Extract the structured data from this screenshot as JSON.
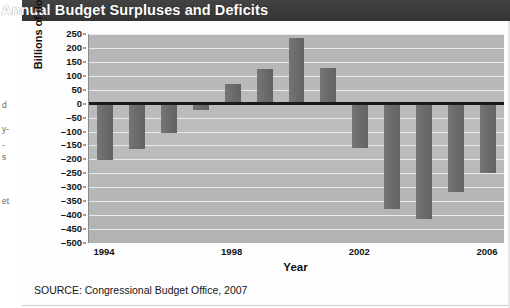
{
  "header": {
    "title": "Annual Budget Surpluses and Deficits"
  },
  "margin_fragments": [
    {
      "text": "d",
      "top": 100
    },
    {
      "text": "y-",
      "top": 124
    },
    {
      "text": "-",
      "top": 140
    },
    {
      "text": "s",
      "top": 152
    },
    {
      "text": "et",
      "top": 196
    }
  ],
  "source": {
    "text": "SOURCE: Congressional Budget Office, 2007"
  },
  "colors": {
    "title_bar": "#3a3a3a",
    "panel": "#b9b9b9",
    "bar": "#6e6e6e",
    "gridline": "#efefef",
    "zero_line": "#1a1a1a",
    "text": "#141414"
  },
  "chart_data": {
    "type": "bar",
    "title": "Annual Budget Surpluses and Deficits",
    "xlabel": "Year",
    "ylabel": "Billions of dollars",
    "ylim": [
      -500,
      250
    ],
    "yticks": [
      250,
      200,
      150,
      100,
      50,
      0,
      -50,
      -100,
      -150,
      -200,
      -250,
      -300,
      -350,
      -400,
      -450,
      -500
    ],
    "ytick_labels": [
      "250",
      "200",
      "150",
      "100",
      "50",
      "0",
      "–50",
      "–100",
      "–150",
      "–200",
      "–250",
      "–300",
      "–350",
      "–400",
      "–450",
      "–500"
    ],
    "grid": true,
    "legend": "none",
    "categories": [
      1994,
      1995,
      1996,
      1997,
      1998,
      1999,
      2000,
      2001,
      2002,
      2003,
      2004,
      2005,
      2006
    ],
    "xtick_labels": [
      "1994",
      "1998",
      "2002",
      "2006"
    ],
    "xtick_categories": [
      1994,
      1998,
      2002,
      2006
    ],
    "values": [
      -203,
      -164,
      -107,
      -22,
      69,
      125,
      236,
      127,
      -158,
      -378,
      -413,
      -318,
      -248
    ],
    "source": "SOURCE: Congressional Budget Office, 2007"
  }
}
